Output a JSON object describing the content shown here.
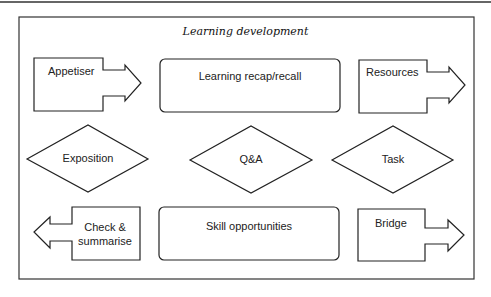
{
  "diagram": {
    "title": "Learning development",
    "stroke_color": "#222222",
    "nodes": [
      {
        "id": "appetiser",
        "label": "Appetiser",
        "shape": "right-arrow-box"
      },
      {
        "id": "recap",
        "label": "Learning recap/recall",
        "shape": "rounded-rect"
      },
      {
        "id": "resources",
        "label": "Resources",
        "shape": "right-arrow-box"
      },
      {
        "id": "exposition",
        "label": "Exposition",
        "shape": "diamond"
      },
      {
        "id": "qa",
        "label": "Q&A",
        "shape": "diamond"
      },
      {
        "id": "task",
        "label": "Task",
        "shape": "diamond"
      },
      {
        "id": "check",
        "label_line1": "Check &",
        "label_line2": "summarise",
        "shape": "left-arrow-box"
      },
      {
        "id": "skill",
        "label": "Skill opportunities",
        "shape": "rounded-rect"
      },
      {
        "id": "bridge",
        "label": "Bridge",
        "shape": "right-arrow-box"
      }
    ]
  }
}
